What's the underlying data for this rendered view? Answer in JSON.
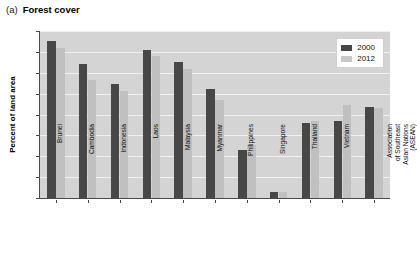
{
  "figure": {
    "panel_tag": "(a)",
    "title": "Forest cover"
  },
  "legend": {
    "position": "top-right",
    "items": [
      {
        "label": "2000",
        "color": "#474747"
      },
      {
        "label": "2012",
        "color": "#c9c9c9"
      }
    ]
  },
  "axes": {
    "ylabel": "Percent of land area",
    "xlabel": "",
    "yticks": [
      "0",
      "10",
      "20",
      "30",
      "40",
      "50",
      "60",
      "70",
      "80"
    ]
  },
  "chart_data": {
    "type": "bar",
    "title": "(a) Forest cover",
    "xlabel": "",
    "ylabel": "Percent of land area",
    "ylim": [
      0,
      80
    ],
    "ytick_step": 10,
    "grid": true,
    "legend_position": "top-right",
    "categories": [
      "Brunei",
      "Cambodia",
      "Indonesia",
      "Laos",
      "Malaysia",
      "Myanmar",
      "Philippines",
      "Singapore",
      "Thailand",
      "Vietnam",
      "Association of Southeast Asian Nations (ASEAN)"
    ],
    "category_lines": [
      [
        "Brunei"
      ],
      [
        "Cambodia"
      ],
      [
        "Indonesia"
      ],
      [
        "Laos"
      ],
      [
        "Malaysia"
      ],
      [
        "Myanmar"
      ],
      [
        "Philippines"
      ],
      [
        "Singapore"
      ],
      [
        "Thailand"
      ],
      [
        "Vietnam"
      ],
      [
        "Association",
        "of Southeast",
        "Asian Nations",
        "(ASEAN)"
      ]
    ],
    "series": [
      {
        "name": "2000",
        "color": "#474747",
        "values": [
          75,
          64,
          54.5,
          71,
          65,
          52,
          23,
          3,
          36,
          37,
          43.5
        ]
      },
      {
        "name": "2012",
        "color": "#c9c9c9",
        "values": [
          72,
          56.5,
          51.5,
          68,
          62,
          47,
          25.5,
          3,
          37,
          44.5,
          43
        ]
      }
    ]
  }
}
